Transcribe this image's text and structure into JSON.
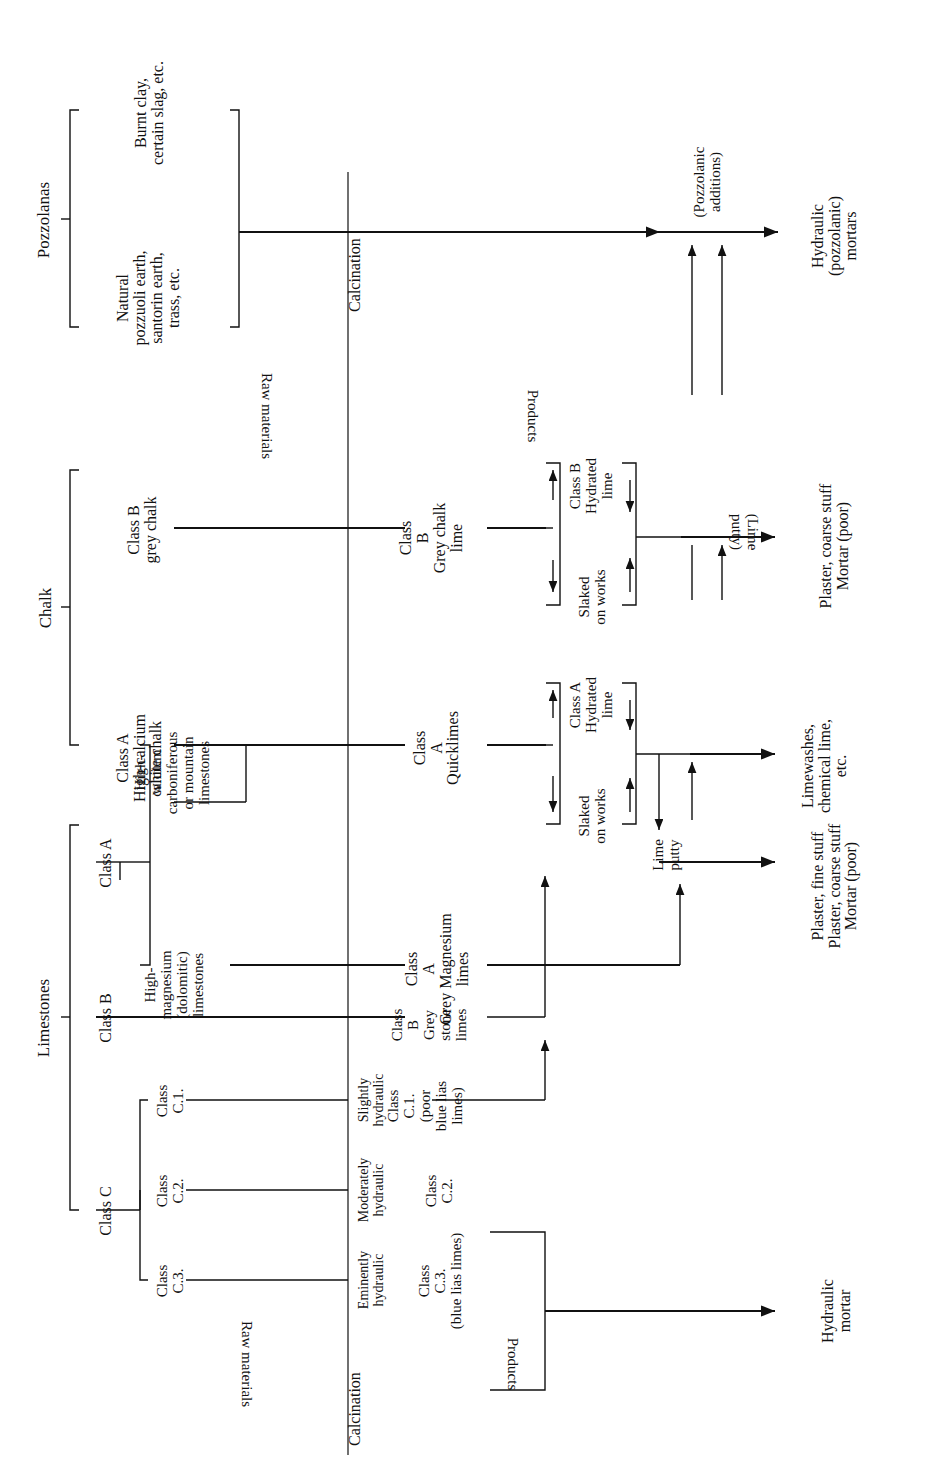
{
  "diagram": {
    "orientation": "rotated-90-ccw",
    "column_labels": {
      "raw_materials": "Raw materials",
      "calcination": "Calcination",
      "products": "Products"
    },
    "groups": {
      "pozzolanas": "Pozzolanas",
      "chalk": "Chalk",
      "limestones": "Limestones"
    },
    "raw_materials": {
      "pozzolana_burnt": "Burnt clay,\ncertain slag, etc.",
      "pozzolana_natural": "Natural\npozzuoli earth,\nsantorin earth,\ntrass, etc.",
      "chalk_class_b": "Class B\ngrey chalk",
      "chalk_class_a": "Class A\nHigh-calcium\nwhite chalk",
      "limestone_class_a_label": "Class A",
      "limestone_high_calcium": "High-\ncalcium\ncarboniferous\nor mountain\nlimestones",
      "limestone_high_magnesium": "High-\nmagnesium\n(dolomitic)\nlimestones",
      "limestone_class_b": "Class B",
      "limestone_class_c": "Class C",
      "limestone_class_c1": "Class\nC.1.",
      "limestone_class_c2": "Class\nC.2.",
      "limestone_class_c3": "Class\nC.3."
    },
    "hydraulicity": {
      "slightly": "Slightly\nhydraulic",
      "moderately": "Moderately\nhydraulic",
      "eminently": "Eminently\nhydraulic"
    },
    "products": {
      "class_b_grey_chalk_lime": "Class\nB\nGrey chalk\nlime",
      "class_a_quicklimes": "Class\nA\nQuicklimes",
      "class_a_grey_magnesium_limes": "Class\nA\nGrey Magnesium\nlimes",
      "class_b_grey_stone_limes": "Class\nB\nGrey\nstone\nlimes",
      "class_c1": "Class\nC.1.\n(poor\nblue lias\nlimes)",
      "class_c2": "Class\nC.2.",
      "class_c3": "Class\nC.3.\n(blue lias limes)"
    },
    "processes": {
      "class_b_hydrated_lime": "Class B\nHydrated\nlime",
      "class_b_slaked_on_works": "Slaked\non works",
      "class_a_hydrated_lime": "Class A\nHydrated\nlime",
      "class_a_slaked_on_works": "Slaked\non works",
      "lime_putty_lower": "Lime\nputty",
      "lime_putty_upper": "(Lime\nputty)",
      "pozzolanic_additions": "(Pozzolanic\nadditions)"
    },
    "outputs": {
      "hydraulic_pozzolanic_mortars": "Hydraulic\n(pozzolanic)\nmortars",
      "plaster_coarse_mortar_poor": "Plaster, coarse stuff\nMortar (poor)",
      "limewashes_chemical_lime": "Limewashes,\nchemical lime,\netc.",
      "plaster_fine_coarse_mortar": "Plaster, fine stuff\nPlaster, coarse stuff\nMortar (poor)",
      "hydraulic_mortar": "Hydraulic\nmortar"
    },
    "colors": {
      "ink": "#111111",
      "paper": "#ffffff"
    }
  }
}
